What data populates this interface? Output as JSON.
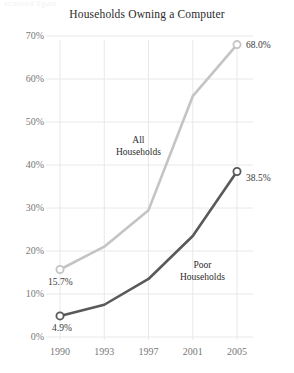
{
  "scan_artifact_text": "scanned figure",
  "chart_data": {
    "type": "line",
    "title": "Households Owning a Computer",
    "xlabel": "",
    "ylabel": "",
    "categories": [
      "1990",
      "1993",
      "1997",
      "2001",
      "2005"
    ],
    "ylim": [
      0,
      70
    ],
    "y_ticks": [
      "0%",
      "10%",
      "20%",
      "30%",
      "40%",
      "50%",
      "60%",
      "70%"
    ],
    "y_tick_values": [
      0,
      10,
      20,
      30,
      40,
      50,
      60,
      70
    ],
    "grid": true,
    "legend_position": "inline-annotations",
    "series": [
      {
        "name": "All Households",
        "color": "#c4c4c4",
        "values": [
          15.7,
          21.0,
          29.5,
          56.0,
          68.0
        ],
        "annotation": [
          "All",
          "Households"
        ],
        "endpoint_labels": {
          "first": "15.7%",
          "last": "68.0%"
        }
      },
      {
        "name": "Poor Households",
        "color": "#595959",
        "values": [
          4.9,
          7.5,
          13.5,
          23.5,
          38.5
        ],
        "annotation": [
          "Poor",
          "Households"
        ],
        "endpoint_labels": {
          "first": "4.9%",
          "last": "38.5%"
        }
      }
    ],
    "colors": {
      "all_households": "#c4c4c4",
      "poor_households": "#595959",
      "grid": "#e8e8e8",
      "axis_text": "#777777",
      "title_text": "#2b2b2b"
    }
  }
}
